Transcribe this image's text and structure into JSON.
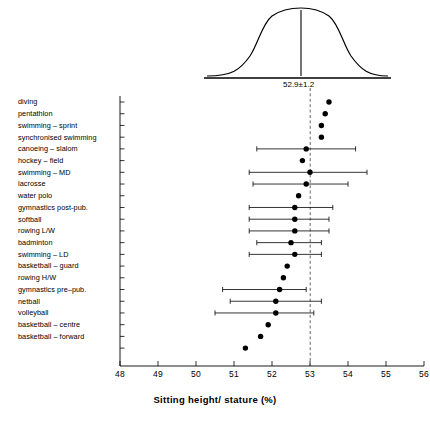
{
  "chart_data": {
    "type": "scatter",
    "title": "",
    "xlabel": "Sitting height/ stature (%)",
    "ylabel": "",
    "xlim": [
      48,
      56
    ],
    "xticks": [
      48,
      49,
      50,
      51,
      52,
      53,
      54,
      55,
      56
    ],
    "xtick_labels": [
      "48",
      "49",
      "50",
      "51",
      "52",
      "53",
      "54",
      "55",
      "56"
    ],
    "grid": false,
    "legend": null,
    "reference_line": {
      "value": 52.9,
      "style": "dashed",
      "label": "52.9±1.2"
    },
    "distribution_curve": {
      "shape": "normal",
      "mean": 52.9,
      "sd": 1.2,
      "annotation": "52.9±1.2",
      "center_line": true
    },
    "categories": [
      "diving",
      "pentathlon",
      "swimming – sprint",
      "synchronised swimming",
      "canoeing – slalom",
      "hockey – field",
      "swimming – MD",
      "lacrosse",
      "water polo",
      "gymnastics post-pub.",
      "softball",
      "rowing L/W",
      "badminton",
      "swimming – LD",
      "basketball – guard",
      "rowing H/W",
      "gymnastics pre–pub.",
      "netball",
      "volleyball",
      "basketball – centre",
      "basketball – forward"
    ],
    "points": [
      {
        "category": "diving",
        "value": 53.5,
        "low": null,
        "high": null
      },
      {
        "category": "pentathlon",
        "value": 53.4,
        "low": null,
        "high": null
      },
      {
        "category": "swimming – sprint",
        "value": 53.3,
        "low": null,
        "high": null
      },
      {
        "category": "synchronised swimming",
        "value": 53.3,
        "low": null,
        "high": null
      },
      {
        "category": "canoeing – slalom",
        "value": 52.9,
        "low": 51.6,
        "high": 54.2
      },
      {
        "category": "hockey – field",
        "value": 52.8,
        "low": null,
        "high": null
      },
      {
        "category": "swimming – MD",
        "value": 53.0,
        "low": 51.4,
        "high": 54.5
      },
      {
        "category": "lacrosse",
        "value": 52.9,
        "low": 51.5,
        "high": 54.0
      },
      {
        "category": "water polo",
        "value": 52.7,
        "low": null,
        "high": null
      },
      {
        "category": "gymnastics post-pub.",
        "value": 52.6,
        "low": 51.4,
        "high": 53.6
      },
      {
        "category": "softball",
        "value": 52.6,
        "low": 51.4,
        "high": 53.5
      },
      {
        "category": "rowing L/W",
        "value": 52.6,
        "low": 51.4,
        "high": 53.5
      },
      {
        "category": "badminton",
        "value": 52.5,
        "low": 51.6,
        "high": 53.3
      },
      {
        "category": "swimming – LD",
        "value": 52.6,
        "low": 51.4,
        "high": 53.3
      },
      {
        "category": "basketball – guard",
        "value": 52.4,
        "low": null,
        "high": null
      },
      {
        "category": "rowing H/W",
        "value": 52.3,
        "low": null,
        "high": null
      },
      {
        "category": "gymnastics pre–pub.",
        "value": 52.2,
        "low": 50.7,
        "high": 52.9
      },
      {
        "category": "netball",
        "value": 52.1,
        "low": 50.9,
        "high": 53.3
      },
      {
        "category": "volleyball",
        "value": 52.1,
        "low": 50.5,
        "high": 53.1
      },
      {
        "category": "basketball – centre",
        "value": 51.9,
        "low": null,
        "high": null
      },
      {
        "category": "basketball – forward",
        "value": 51.7,
        "low": null,
        "high": null
      },
      {
        "category": "basketball – forward2",
        "value": 51.3,
        "low": null,
        "high": null
      }
    ]
  }
}
